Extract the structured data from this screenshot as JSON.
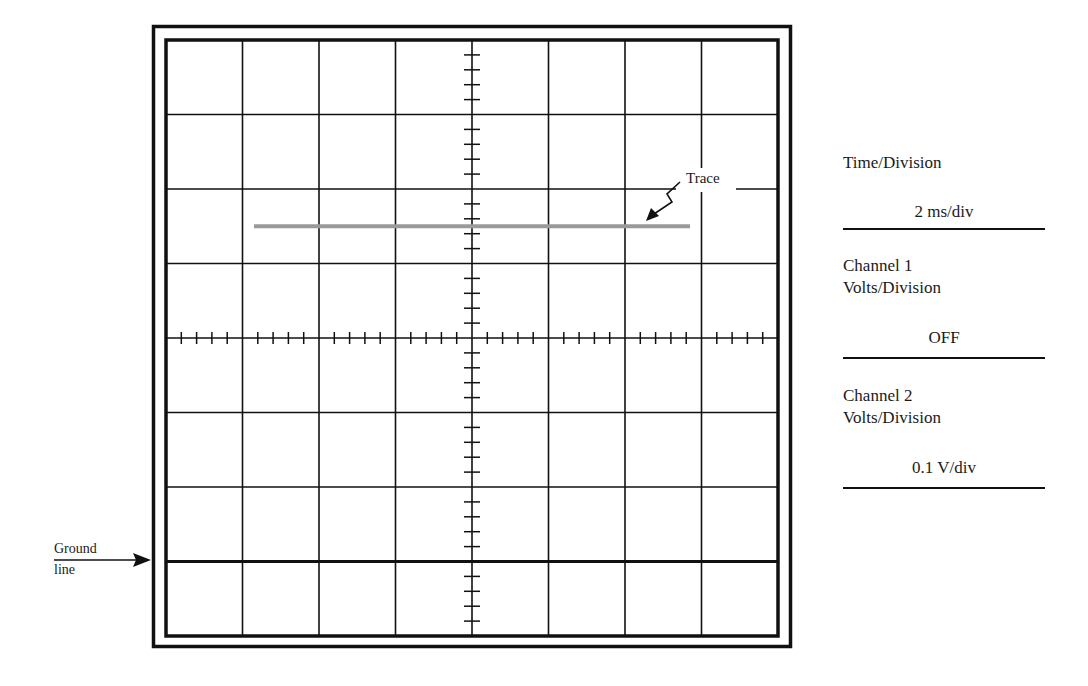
{
  "diagram": {
    "type": "oscilloscope-display",
    "grid": {
      "divisions_x": 8,
      "divisions_y": 8,
      "minor_ticks_per_division": 5
    },
    "trace": {
      "label": "Trace",
      "color": "#9a9a9a",
      "level_divisions_above_ground": 4.5,
      "x_start_div": 1.15,
      "x_end_div": 6.85
    },
    "ground_line": {
      "label_line1": "Ground",
      "label_line2": "line",
      "level_divisions_from_top": 7
    }
  },
  "settings_panel": {
    "time_division": {
      "label": "Time/Division",
      "value": "2 ms/div"
    },
    "channel1": {
      "label_line1": "Channel 1",
      "label_line2": "Volts/Division",
      "value": "OFF"
    },
    "channel2": {
      "label_line1": "Channel 2",
      "label_line2": "Volts/Division",
      "value": "0.1 V/div"
    }
  },
  "colors": {
    "grid": "#111111",
    "trace": "#9a9a9a",
    "background": "#ffffff"
  }
}
